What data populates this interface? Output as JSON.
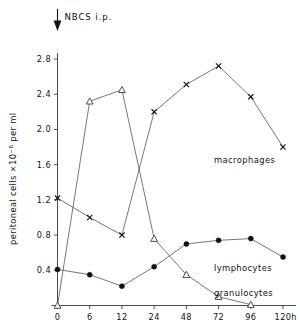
{
  "figure": {
    "annotation": {
      "text": "NBCS i.p.",
      "icon": "down-arrow-icon",
      "at_hour": 0
    }
  },
  "axes": {
    "y_title_main": "peritoneal cells ×10",
    "y_title_exponent": "−6",
    "y_title_tail": " per ml",
    "y_ticks": [
      "0.4",
      "0.8",
      "1.2",
      "1.6",
      "2.0",
      "2.4",
      "2.8"
    ],
    "x_ticks": [
      "0",
      "6",
      "12",
      "24",
      "48",
      "72",
      "96",
      "120"
    ],
    "x_unit": "h"
  },
  "series_labels": {
    "macrophages": "macrophages",
    "lymphocytes": "lymphocytes",
    "granulocytes": "granulocytes"
  },
  "chart_data": {
    "type": "line",
    "title": "",
    "xlabel": "h",
    "ylabel": "peritoneal cells ×10−6 per ml",
    "x": [
      0,
      6,
      12,
      24,
      48,
      72,
      96,
      120
    ],
    "x_scale": "categorical-even-spacing",
    "xlim": [
      0,
      120
    ],
    "ylim": [
      0,
      2.95
    ],
    "y_ticks": [
      0.4,
      0.8,
      1.2,
      1.6,
      2.0,
      2.4,
      2.8
    ],
    "grid": false,
    "legend": "inline-right-annotations",
    "annotations": [
      {
        "text": "NBCS i.p.",
        "x": 0,
        "marker": "down-arrow"
      }
    ],
    "series": [
      {
        "name": "macrophages",
        "marker": "cross",
        "x": [
          0,
          6,
          12,
          24,
          48,
          72,
          96,
          120
        ],
        "values": [
          1.22,
          1.0,
          0.8,
          2.2,
          2.51,
          2.72,
          2.37,
          1.8
        ]
      },
      {
        "name": "granulocytes",
        "marker": "open-triangle",
        "x": [
          0,
          6,
          12,
          24,
          48,
          72,
          96
        ],
        "values": [
          0.0,
          2.32,
          2.45,
          0.76,
          0.35,
          0.1,
          0.01
        ]
      },
      {
        "name": "lymphocytes",
        "marker": "filled-circle",
        "x": [
          0,
          6,
          12,
          24,
          48,
          72,
          96,
          120
        ],
        "values": [
          0.41,
          0.35,
          0.22,
          0.44,
          0.7,
          0.74,
          0.76,
          0.55
        ]
      }
    ]
  }
}
